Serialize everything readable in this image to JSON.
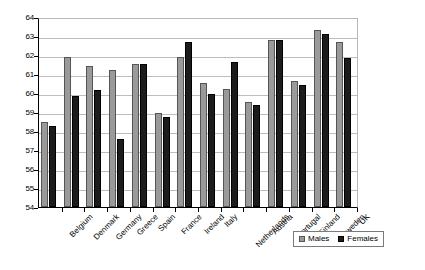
{
  "chart_data": {
    "type": "bar",
    "title": "",
    "subtitle": "",
    "xlabel": "",
    "ylabel": "",
    "ylim": [
      54,
      64
    ],
    "yticks": [
      54,
      55,
      56,
      57,
      58,
      59,
      60,
      61,
      62,
      63,
      64
    ],
    "grid": true,
    "legend_position": "bottom-right",
    "categories": [
      "Belgium",
      "Denmark",
      "Germany",
      "Greece",
      "Spain",
      "France",
      "Ireland",
      "Italy",
      "Netherlands",
      "Austria",
      "Portugal",
      "Finland",
      "Sweden",
      "UK"
    ],
    "series": [
      {
        "name": "Males",
        "color": "#9a9a9a",
        "values": [
          58.5,
          62.0,
          61.5,
          61.3,
          61.6,
          59.0,
          62.0,
          60.6,
          60.3,
          59.6,
          62.9,
          60.7,
          63.4,
          62.8
        ]
      },
      {
        "name": "Females",
        "color": "#1c1c1c",
        "values": [
          58.3,
          59.9,
          60.2,
          57.6,
          61.6,
          58.8,
          62.8,
          60.0,
          61.7,
          59.4,
          62.9,
          60.5,
          63.2,
          61.9
        ]
      }
    ]
  },
  "legend": {
    "items": [
      {
        "label": "Males",
        "swatch": "males-swatch"
      },
      {
        "label": "Females",
        "swatch": "females-swatch"
      }
    ]
  }
}
